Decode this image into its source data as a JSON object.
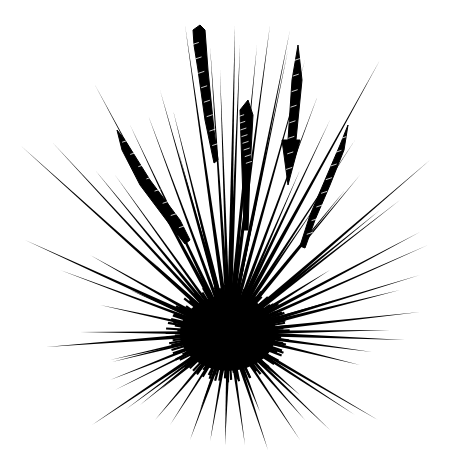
{
  "image": {
    "subject": "sea urchin illustration",
    "width": 455,
    "height": 458,
    "background": "#ffffff",
    "ink": "#000000"
  },
  "body": {
    "cx": 228,
    "cy": 333,
    "rx": 48,
    "ry": 38
  },
  "spines": [
    [
      229,
      333,
      380,
      60,
      1.4
    ],
    [
      229,
      333,
      430,
      160,
      1.2
    ],
    [
      229,
      333,
      420,
      232,
      1.3
    ],
    [
      229,
      333,
      428,
      245,
      1.1
    ],
    [
      229,
      333,
      380,
      210,
      1.3
    ],
    [
      229,
      333,
      400,
      200,
      1.0
    ],
    [
      229,
      333,
      345,
      190,
      1.2
    ],
    [
      229,
      333,
      420,
      275,
      1.2
    ],
    [
      229,
      333,
      400,
      290,
      1.4
    ],
    [
      229,
      333,
      420,
      312,
      1.3
    ],
    [
      229,
      333,
      390,
      330,
      1.2
    ],
    [
      229,
      333,
      405,
      340,
      1.4
    ],
    [
      229,
      333,
      372,
      352,
      1.2
    ],
    [
      229,
      333,
      360,
      365,
      1.3
    ],
    [
      229,
      333,
      378,
      420,
      1.2
    ],
    [
      229,
      333,
      355,
      415,
      1.2
    ],
    [
      229,
      333,
      330,
      430,
      1.1
    ],
    [
      229,
      333,
      305,
      420,
      1.2
    ],
    [
      229,
      333,
      300,
      440,
      1.0
    ],
    [
      229,
      333,
      268,
      450,
      1.2
    ],
    [
      229,
      333,
      245,
      445,
      1.1
    ],
    [
      229,
      333,
      225,
      445,
      1.3
    ],
    [
      229,
      333,
      210,
      442,
      1.1
    ],
    [
      229,
      333,
      190,
      440,
      1.2
    ],
    [
      229,
      333,
      170,
      425,
      1.0
    ],
    [
      229,
      333,
      155,
      420,
      1.2
    ],
    [
      229,
      333,
      140,
      405,
      1.1
    ],
    [
      229,
      333,
      92,
      425,
      1.3
    ],
    [
      229,
      333,
      125,
      410,
      1.1
    ],
    [
      229,
      333,
      110,
      380,
      1.2
    ],
    [
      229,
      333,
      115,
      390,
      1.0
    ],
    [
      229,
      333,
      112,
      362,
      1.2
    ],
    [
      229,
      333,
      46,
      347,
      1.4
    ],
    [
      229,
      333,
      80,
      332,
      1.1
    ],
    [
      229,
      333,
      100,
      305,
      1.2
    ],
    [
      229,
      333,
      110,
      360,
      1.0
    ],
    [
      229,
      333,
      25,
      240,
      1.3
    ],
    [
      229,
      333,
      60,
      270,
      1.1
    ],
    [
      229,
      333,
      90,
      255,
      1.2
    ],
    [
      229,
      333,
      20,
      145,
      1.2
    ],
    [
      229,
      333,
      52,
      142,
      1.1
    ],
    [
      229,
      333,
      95,
      170,
      1.2
    ],
    [
      229,
      333,
      115,
      175,
      1.0
    ],
    [
      229,
      333,
      95,
      85,
      1.3
    ],
    [
      229,
      333,
      148,
      115,
      1.1
    ],
    [
      229,
      333,
      130,
      125,
      1.2
    ],
    [
      229,
      333,
      185,
      25,
      1.3
    ],
    [
      229,
      333,
      160,
      90,
      1.1
    ],
    [
      229,
      333,
      173,
      110,
      1.2
    ],
    [
      229,
      333,
      210,
      45,
      1.1
    ],
    [
      229,
      333,
      235,
      25,
      1.4
    ],
    [
      229,
      333,
      240,
      45,
      1.2
    ],
    [
      229,
      333,
      220,
      70,
      1.0
    ],
    [
      229,
      333,
      257,
      45,
      1.2
    ],
    [
      229,
      333,
      270,
      25,
      1.3
    ],
    [
      229,
      333,
      290,
      30,
      1.2
    ],
    [
      229,
      333,
      288,
      50,
      1.0
    ],
    [
      229,
      333,
      305,
      60,
      1.2
    ],
    [
      229,
      333,
      318,
      95,
      1.1
    ],
    [
      229,
      333,
      330,
      120,
      1.2
    ],
    [
      229,
      333,
      355,
      140,
      1.0
    ],
    [
      229,
      333,
      360,
      175,
      1.1
    ],
    [
      229,
      333,
      195,
      200,
      1.3
    ],
    [
      229,
      333,
      178,
      150,
      1.2
    ],
    [
      229,
      333,
      265,
      160,
      1.2
    ],
    [
      229,
      333,
      250,
      130,
      1.1
    ],
    [
      229,
      333,
      300,
      170,
      1.2
    ],
    [
      229,
      333,
      320,
      200,
      1.1
    ],
    [
      229,
      333,
      150,
      260,
      1.5
    ],
    [
      229,
      333,
      130,
      290,
      1.5
    ],
    [
      229,
      333,
      330,
      270,
      1.5
    ],
    [
      229,
      333,
      335,
      300,
      1.5
    ],
    [
      229,
      333,
      160,
      390,
      1.6
    ],
    [
      229,
      333,
      300,
      395,
      1.6
    ],
    [
      229,
      333,
      200,
      410,
      1.6
    ],
    [
      229,
      333,
      260,
      412,
      1.6
    ]
  ],
  "pedicellariae": [
    {
      "name": "top-left-club",
      "points": "193,30 200,25 205,30 208,70 214,130 218,160 214,163 205,120 198,70 194,45"
    },
    {
      "name": "center-feather",
      "points": "240,110 248,100 253,115 250,170 248,230 244,230 242,170"
    },
    {
      "name": "right-arrow",
      "points": "298,45 302,80 296,140 300,140 288,185 282,140 288,140 292,80"
    },
    {
      "name": "left-feather",
      "points": "117,130 125,140 150,180 180,220 190,240 185,244 170,225 140,185 122,150"
    },
    {
      "name": "right-feather",
      "points": "348,125 344,150 330,185 315,220 305,248 300,246 310,215 325,180 340,145"
    }
  ]
}
